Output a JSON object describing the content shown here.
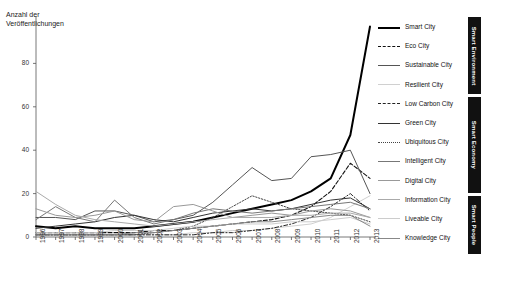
{
  "chart_data": {
    "type": "line",
    "title": "",
    "ylabel": "Anzahl der Veröffentlichungen",
    "xlabel": "",
    "ylim": [
      0,
      100
    ],
    "yticks": [
      0,
      20,
      40,
      60,
      80
    ],
    "grid": false,
    "legend_position": "right",
    "categories": [
      "1996",
      "1997",
      "1998",
      "1999",
      "2000",
      "2001",
      "2002",
      "2003",
      "2004",
      "2005",
      "2006",
      "2007",
      "2008",
      "2009",
      "2010",
      "2011",
      "2012",
      "2013"
    ],
    "series": [
      {
        "name": "Smart City",
        "group": "Smart Environment",
        "style": "solid",
        "width": 2.0,
        "color": "#000000",
        "values": [
          5,
          4,
          5,
          4,
          4,
          4,
          5,
          6,
          7,
          9,
          11,
          13,
          15,
          17,
          21,
          27,
          47,
          97
        ]
      },
      {
        "name": "Eco City",
        "group": "Smart Environment",
        "style": "dashed",
        "width": 1.1,
        "color": "#111111",
        "values": [
          2,
          2,
          2,
          2,
          2,
          2,
          3,
          3,
          4,
          5,
          6,
          7,
          8,
          10,
          14,
          21,
          34,
          27
        ]
      },
      {
        "name": "Sustainable City",
        "group": "Smart Environment",
        "style": "solid",
        "width": 1.0,
        "color": "#555555",
        "values": [
          9,
          9,
          8,
          12,
          12,
          10,
          7,
          8,
          10,
          16,
          24,
          32,
          26,
          27,
          37,
          38,
          40,
          20
        ]
      },
      {
        "name": "Resilient City",
        "group": "Smart Environment",
        "style": "solid",
        "width": 1.0,
        "color": "#d0d0d0",
        "values": [
          1,
          1,
          1,
          1,
          1,
          1,
          1,
          1,
          2,
          2,
          3,
          3,
          4,
          5,
          6,
          9,
          14,
          19
        ]
      },
      {
        "name": "Low Carbon City",
        "group": "Smart Economy",
        "style": "dashdot",
        "width": 1.0,
        "color": "#222222",
        "values": [
          1,
          1,
          1,
          1,
          1,
          1,
          1,
          1,
          1,
          2,
          2,
          3,
          4,
          6,
          9,
          14,
          20,
          12
        ]
      },
      {
        "name": "Green City",
        "group": "Smart Economy",
        "style": "solid",
        "width": 1.0,
        "color": "#333333",
        "values": [
          4,
          5,
          6,
          7,
          9,
          10,
          8,
          7,
          9,
          11,
          12,
          13,
          12,
          13,
          15,
          17,
          18,
          13
        ]
      },
      {
        "name": "Ubiquitous City",
        "group": "Smart Economy",
        "style": "dotted",
        "width": 1.0,
        "color": "#444444",
        "values": [
          1,
          1,
          1,
          1,
          1,
          1,
          2,
          3,
          5,
          9,
          14,
          19,
          16,
          13,
          12,
          11,
          10,
          7
        ]
      },
      {
        "name": "Intelligent City",
        "group": "Smart Economy",
        "style": "solid",
        "width": 1.0,
        "color": "#777777",
        "values": [
          8,
          14,
          9,
          7,
          17,
          9,
          6,
          8,
          11,
          13,
          12,
          11,
          12,
          13,
          14,
          15,
          16,
          13
        ]
      },
      {
        "name": "Digital City",
        "group": "Smart Economy",
        "style": "solid",
        "width": 1.0,
        "color": "#999999",
        "values": [
          13,
          10,
          9,
          10,
          12,
          8,
          7,
          14,
          15,
          12,
          9,
          10,
          11,
          10,
          12,
          13,
          12,
          9
        ]
      },
      {
        "name": "Information City",
        "group": "Smart People",
        "style": "solid",
        "width": 1.0,
        "color": "#aaaaaa",
        "values": [
          21,
          15,
          10,
          8,
          7,
          6,
          5,
          6,
          7,
          8,
          9,
          9,
          9,
          10,
          10,
          11,
          11,
          9
        ]
      },
      {
        "name": "Liveable City",
        "group": "Smart People",
        "style": "solid",
        "width": 1.0,
        "color": "#cccccc",
        "values": [
          2,
          2,
          2,
          2,
          3,
          3,
          3,
          4,
          5,
          5,
          6,
          6,
          6,
          7,
          7,
          8,
          9,
          6
        ]
      },
      {
        "name": "Knowledge City",
        "group": "Smart People",
        "style": "solid",
        "width": 1.0,
        "color": "#888888",
        "values": [
          1,
          1,
          1,
          1,
          1,
          2,
          2,
          3,
          4,
          5,
          6,
          7,
          7,
          8,
          9,
          10,
          10,
          5
        ]
      }
    ],
    "groups": [
      {
        "label": "Smart Environment",
        "top": 0,
        "height": 77
      },
      {
        "label": "Smart Economy",
        "top": 80,
        "height": 96
      },
      {
        "label": "Smart People",
        "top": 179,
        "height": 58
      }
    ]
  }
}
